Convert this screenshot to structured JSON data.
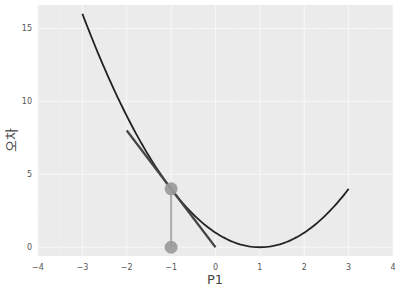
{
  "chart_data": {
    "type": "line",
    "title": "",
    "xlabel": "P1",
    "ylabel": "오차",
    "xlim": [
      -4,
      4
    ],
    "ylim": [
      -0.6,
      16.6
    ],
    "grid": true,
    "xticks": [
      -4,
      -3,
      -2,
      -1,
      0,
      1,
      2,
      3,
      4
    ],
    "yticks": [
      0,
      5,
      10,
      15
    ],
    "xtick_labels": [
      "−4",
      "−3",
      "−2",
      "−1",
      "0",
      "1",
      "2",
      "3",
      "4"
    ],
    "ytick_labels": [
      "0",
      "5",
      "10",
      "15"
    ],
    "series": [
      {
        "name": "error curve",
        "kind": "line",
        "formula": "y = (x - 1)^2",
        "x_range": [
          -3,
          3
        ],
        "color": "#222222",
        "x": [
          -3,
          -2.5,
          -2,
          -1.5,
          -1,
          -0.5,
          0,
          0.5,
          1,
          1.5,
          2,
          2.5,
          3
        ],
        "values": [
          16,
          12.25,
          9,
          6.25,
          4,
          2.25,
          1,
          0.25,
          0,
          0.25,
          1,
          2.25,
          4
        ]
      },
      {
        "name": "tangent at x=-1",
        "kind": "line",
        "formula": "y = -4x",
        "color": "#444444",
        "x": [
          -2,
          0
        ],
        "values": [
          8,
          0
        ]
      },
      {
        "name": "points",
        "kind": "scatter",
        "color": "#999999",
        "x": [
          -1,
          -1
        ],
        "values": [
          4,
          0
        ]
      },
      {
        "name": "vertical segment",
        "kind": "line",
        "color": "#aaaaaa",
        "x": [
          -1,
          -1
        ],
        "values": [
          4,
          0
        ]
      }
    ],
    "background": "#ebebeb",
    "gridline_color": "#f7f7f7"
  }
}
